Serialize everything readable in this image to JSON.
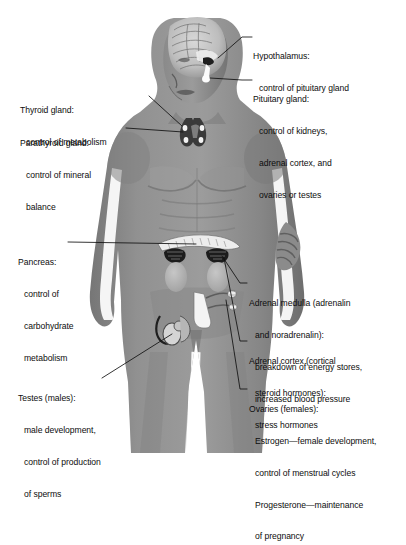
{
  "diagram": {
    "colors": {
      "background": "#ffffff",
      "body_mid": "#8d8d8d",
      "body_light": "#a8a8a8",
      "body_dark": "#6f6f6f",
      "body_shadow": "#5a5a5a",
      "gland_dark": "#2a2a2a",
      "gland_light": "#e4e4e4",
      "text": "#0d0d0d",
      "leader_line": "#111111"
    }
  },
  "labels": [
    {
      "id": "hypothalamus",
      "name": "hypothalamus",
      "side": "right",
      "title": "Hypothalamus:",
      "lines": [
        "control of pituitary gland"
      ]
    },
    {
      "id": "pituitary",
      "name": "pituitary-gland",
      "side": "right",
      "title": "Pituitary gland:",
      "lines": [
        "control of kidneys,",
        "adrenal cortex, and",
        "ovaries or testes"
      ]
    },
    {
      "id": "thyroid",
      "name": "thyroid-gland",
      "side": "left",
      "title": "Thyroid gland:",
      "lines": [
        "control of metabolism"
      ]
    },
    {
      "id": "parathyroid",
      "name": "parathyroid-gland",
      "side": "left",
      "title": "Parathyroid gland:",
      "lines": [
        "control of mineral",
        "balance"
      ]
    },
    {
      "id": "pancreas",
      "name": "pancreas",
      "side": "left",
      "title": "Pancreas:",
      "lines": [
        "control of",
        "carbohydrate",
        "metabolism"
      ]
    },
    {
      "id": "testes",
      "name": "testes",
      "side": "left",
      "title": "Testes (males):",
      "lines": [
        "male development,",
        "control of production",
        "of sperms"
      ]
    },
    {
      "id": "adrenal-medulla",
      "name": "adrenal-medulla",
      "side": "right",
      "title": "Adrenal medulla (adrenalin",
      "lines": [
        "and noradrenalin):",
        "breakdown of energy stores,",
        "increased blood pressure"
      ]
    },
    {
      "id": "adrenal-cortex",
      "name": "adrenal-cortex",
      "side": "right",
      "title": "Adrenal cortex (cortical",
      "lines": [
        "steroid hormones):",
        "stress hormones"
      ]
    },
    {
      "id": "ovaries",
      "name": "ovaries",
      "side": "right",
      "title": "Ovaries (females):",
      "lines": [
        "Estrogen—female development,",
        "control of menstrual cycles",
        "Progesterone—maintenance",
        "of pregnancy"
      ]
    }
  ]
}
